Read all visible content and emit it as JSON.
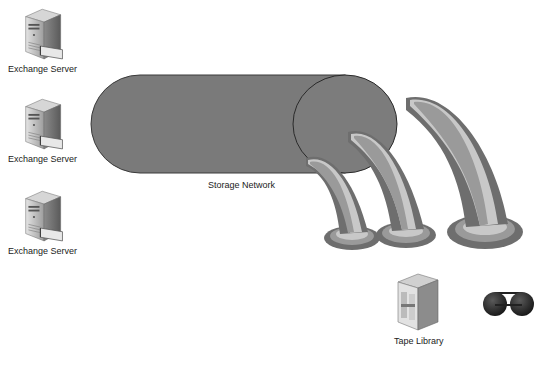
{
  "diagram": {
    "servers": [
      {
        "label": "Exchange Server",
        "x": 22,
        "y": 8,
        "label_x": 8,
        "label_y": 64
      },
      {
        "label": "Exchange Server",
        "x": 22,
        "y": 104,
        "label_x": 8,
        "label_y": 154
      },
      {
        "label": "Exchange Server",
        "x": 22,
        "y": 196,
        "label_x": 8,
        "label_y": 246
      }
    ],
    "storage_network": {
      "label": "Storage Network",
      "label_x": 208,
      "label_y": 180
    },
    "tape_library": {
      "label": "Tape Library",
      "label_x": 394,
      "label_y": 336
    },
    "tapes_count": 3,
    "colors": {
      "pipe_fill": "#7a7a7a",
      "pipe_stroke": "#3a3a3a",
      "horn_dark": "#6e6e6e",
      "horn_mid": "#9a9a9a",
      "horn_light": "#c8c8c8",
      "tape_reel": "#2a2a2a"
    }
  }
}
